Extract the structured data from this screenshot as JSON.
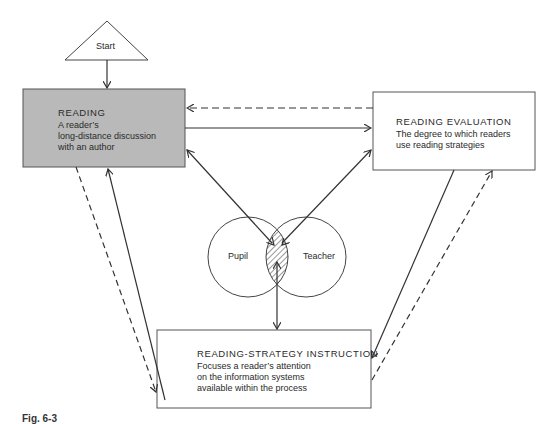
{
  "start": {
    "label": "Start"
  },
  "reading": {
    "title": "READING",
    "lines": [
      "A reader’s",
      "long-distance discussion",
      "with an author"
    ],
    "fill": "#b9b9b9"
  },
  "evaluation": {
    "title": "READING EVALUATION",
    "lines": [
      "The degree to which readers",
      "use reading strategies"
    ]
  },
  "instruction": {
    "title": "READING-STRATEGY INSTRUCTION",
    "lines": [
      "Focuses a reader’s attention",
      "on the information systems",
      "available within the process"
    ]
  },
  "venn": {
    "left": "Pupil",
    "right": "Teacher"
  },
  "caption": "Fig. 6-3",
  "colors": {
    "line": "#333333",
    "box_border": "#444444"
  }
}
